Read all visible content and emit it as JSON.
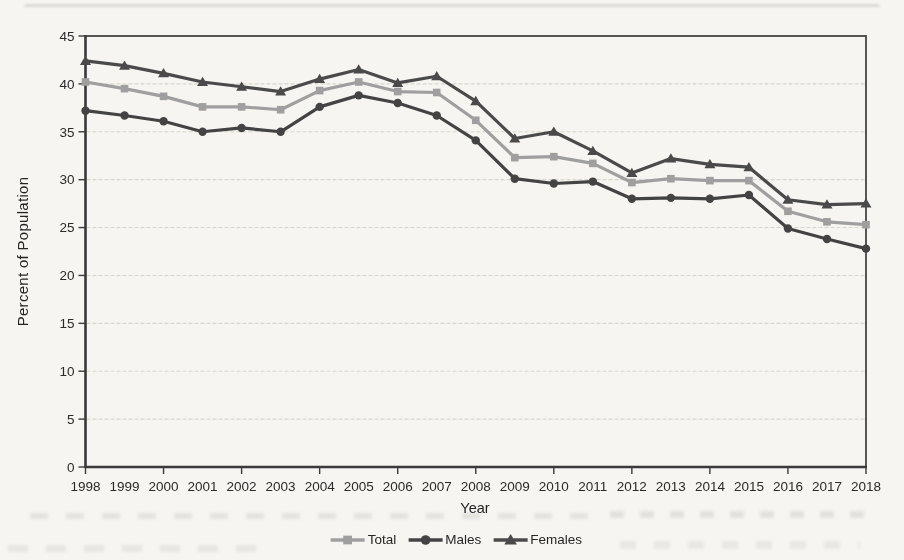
{
  "page": {
    "background_color": "#f7f5f1"
  },
  "chart_data": {
    "type": "line",
    "title": "",
    "xlabel": "Year",
    "ylabel": "Percent of Population",
    "ylim": [
      0,
      45
    ],
    "ytick_step": 5,
    "xtick_every": 2,
    "grid": true,
    "legend_position": "bottom-center",
    "axis_color": "#3a3a3a",
    "grid_color": "#d8d6d0",
    "text_color": "#262626",
    "categories": [
      "1998",
      "1999",
      "2000",
      "2001",
      "2002",
      "2003",
      "2004",
      "2005",
      "2006",
      "2007",
      "2008",
      "2009",
      "2010",
      "2011",
      "2012",
      "2013",
      "2014",
      "2015",
      "2016",
      "2017",
      "2018"
    ],
    "series": [
      {
        "name": "Total",
        "marker": "square",
        "color": "#9f9f9f",
        "values": [
          40.2,
          39.5,
          38.7,
          37.6,
          37.6,
          37.3,
          39.3,
          40.2,
          39.2,
          39.1,
          36.2,
          32.3,
          32.4,
          31.7,
          29.7,
          30.1,
          29.9,
          29.9,
          26.7,
          25.6,
          25.3
        ]
      },
      {
        "name": "Males",
        "marker": "circle",
        "color": "#434343",
        "values": [
          37.2,
          36.7,
          36.1,
          35.0,
          35.4,
          35.0,
          37.6,
          38.8,
          38.0,
          36.7,
          34.1,
          30.1,
          29.6,
          29.8,
          28.0,
          28.1,
          28.0,
          28.4,
          24.9,
          23.8,
          22.8
        ]
      },
      {
        "name": "Females",
        "marker": "triangle",
        "color": "#4a4a4a",
        "values": [
          42.4,
          41.9,
          41.1,
          40.2,
          39.7,
          39.2,
          40.5,
          41.5,
          40.1,
          40.8,
          38.2,
          34.3,
          35.0,
          33.0,
          30.7,
          32.2,
          31.6,
          31.3,
          27.9,
          27.4,
          27.5
        ]
      }
    ]
  }
}
